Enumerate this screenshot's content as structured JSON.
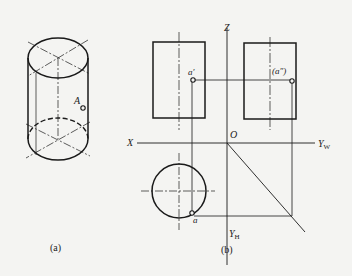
{
  "figure_a": {
    "caption": "(a)",
    "point_label": "A"
  },
  "figure_b": {
    "caption": "(b)",
    "axes": {
      "x": "X",
      "z": "Z",
      "origin": "O",
      "yw": "Y",
      "yw_sub": "W",
      "yh": "Y",
      "yh_sub": "H"
    },
    "points": {
      "front": "a′",
      "side": "(a″)",
      "top": "a"
    }
  },
  "colors": {
    "background": "#f4f4f2",
    "stroke": "#1a1a1a"
  }
}
